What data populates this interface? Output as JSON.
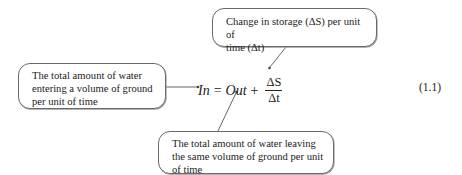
{
  "callouts": {
    "top": {
      "line1": "Change in storage (ΔS) per unit of",
      "line2": "time (Δt)"
    },
    "left": {
      "line1": "The total amount of water",
      "line2": "entering a volume of ground",
      "line3": "per unit of time"
    },
    "bottom": {
      "line1": "The total amount of water leaving",
      "line2": "the same volume of ground per unit",
      "line3": "of time"
    }
  },
  "equation": {
    "lhs": "In",
    "equals": "=",
    "out": "Out",
    "plus": "+",
    "numerator": "ΔS",
    "denominator": "Δt",
    "number": "(1.1)"
  },
  "colors": {
    "border": "#6a6a6a",
    "text": "#222222",
    "connector": "#555555"
  }
}
